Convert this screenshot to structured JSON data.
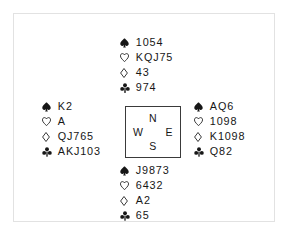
{
  "diagram": {
    "border_color": "#e2e2e2",
    "box_border_color": "#3a3a3a",
    "text_color": "#161616",
    "background": "#ffffff"
  },
  "suits": {
    "spade": {
      "name": "spade-suit-icon",
      "glyph": "♠",
      "filled": true
    },
    "heart": {
      "name": "heart-suit-icon",
      "glyph": "♡",
      "filled": false
    },
    "diamond": {
      "name": "diamond-suit-icon",
      "glyph": "♢",
      "filled": false
    },
    "club": {
      "name": "club-suit-icon",
      "glyph": "♣",
      "filled": true
    }
  },
  "compass": {
    "north": "N",
    "west": "W",
    "east": "E",
    "south": "S"
  },
  "hands": {
    "north": {
      "position": "North",
      "spades": "1054",
      "hearts": "KQJ75",
      "diamonds": "43",
      "clubs": "974"
    },
    "west": {
      "position": "West",
      "spades": "K2",
      "hearts": "A",
      "diamonds": "QJ765",
      "clubs": "AKJ103"
    },
    "east": {
      "position": "East",
      "spades": "AQ6",
      "hearts": "1098",
      "diamonds": "K1098",
      "clubs": "Q82"
    },
    "south": {
      "position": "South",
      "spades": "J9873",
      "hearts": "6432",
      "diamonds": "A2",
      "clubs": "65"
    }
  }
}
